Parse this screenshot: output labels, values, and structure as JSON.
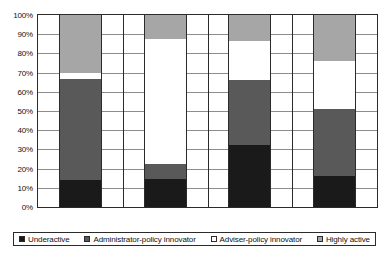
{
  "chart_data": {
    "type": "bar",
    "title": "",
    "subtitle": "",
    "xlabel": "",
    "ylabel": "",
    "stacked": true,
    "stack_mode": "percent",
    "orientation": "vertical",
    "grid": true,
    "legend_position": "bottom",
    "ylim": [
      0,
      100
    ],
    "ytick_labels": [
      "100%",
      "90%",
      "80%",
      "70%",
      "60%",
      "50%",
      "40%",
      "30%",
      "20%",
      "10%",
      "0%"
    ],
    "ytick_values": [
      100,
      90,
      80,
      70,
      60,
      50,
      40,
      30,
      20,
      10,
      0
    ],
    "categories": [
      "Strong-mayor",
      "Committee-leader",
      "Collective",
      "Council-manager"
    ],
    "series": [
      {
        "name": "Underactive",
        "color": "#1a1a1a",
        "values": [
          14,
          14.5,
          32.5,
          16
        ]
      },
      {
        "name": "Administrator-policy innovator",
        "color": "#595959",
        "values": [
          52.5,
          8,
          33.5,
          35
        ]
      },
      {
        "name": "Adviser-policy innovator",
        "color": "#ffffff",
        "values": [
          3.5,
          65,
          20.5,
          25
        ]
      },
      {
        "name": "Highly active",
        "color": "#a6a6a6",
        "values": [
          30,
          12.5,
          13.5,
          24
        ]
      }
    ]
  },
  "axis": {
    "ticks": [
      {
        "label": "100%",
        "value": 100
      },
      {
        "label": "90%",
        "value": 90
      },
      {
        "label": "80%",
        "value": 80
      },
      {
        "label": "70%",
        "value": 70
      },
      {
        "label": "60%",
        "value": 60
      },
      {
        "label": "50%",
        "value": 50
      },
      {
        "label": "40%",
        "value": 40
      },
      {
        "label": "30%",
        "value": 30
      },
      {
        "label": "20%",
        "value": 20
      },
      {
        "label": "10%",
        "value": 10
      },
      {
        "label": "0%",
        "value": 0
      }
    ]
  },
  "categories": [
    {
      "label": "Strong-mayor"
    },
    {
      "label": "Committee-leader"
    },
    {
      "label": "Collective"
    },
    {
      "label": "Council-manager"
    }
  ],
  "legend": {
    "items": [
      {
        "label": "Underactive",
        "color": "#1a1a1a"
      },
      {
        "label": "Administrator-policy innovator",
        "color": "#595959"
      },
      {
        "label": "Adviser-policy innovator",
        "color": "#ffffff"
      },
      {
        "label": "Highly active",
        "color": "#a6a6a6"
      }
    ]
  }
}
